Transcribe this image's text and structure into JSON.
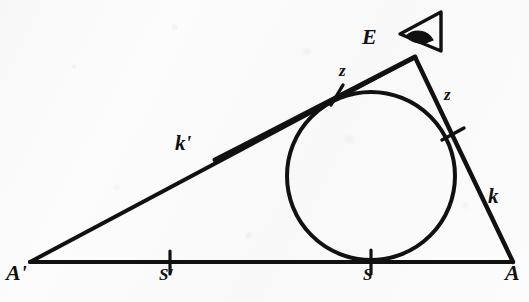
{
  "figure": {
    "background_color": "#fcfcfc",
    "ink_color": "#111111"
  },
  "labels": {
    "vertex_a_prime": "A'",
    "vertex_a": "A",
    "apex_e": "E",
    "point_s_prime": "S'",
    "point_s": "S",
    "side_k_prime": "k'",
    "side_k": "k",
    "tangent_left": "z",
    "tangent_right": "z"
  },
  "icons": {
    "observer": "eye-icon"
  },
  "geometry": {
    "vertex_a_prime": {
      "x": 30,
      "y": 262
    },
    "vertex_a": {
      "x": 513,
      "y": 262
    },
    "apex_e": {
      "x": 415,
      "y": 57
    },
    "circle": {
      "cx": 371,
      "cy": 176,
      "r": 84
    },
    "tick_s_prime": {
      "x": 170,
      "y": 262
    },
    "tick_s": {
      "x": 371,
      "y": 260
    },
    "tick_tangent_k_prime": {
      "x": 337,
      "y": 95
    },
    "tick_tangent_k": {
      "x": 453,
      "y": 134
    },
    "eye": {
      "x": 400,
      "y": 10,
      "w": 44,
      "h": 42
    }
  }
}
